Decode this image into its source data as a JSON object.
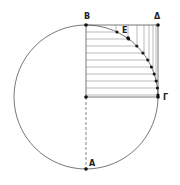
{
  "diagram": {
    "type": "geometric-construction",
    "circle": {
      "cx": 86,
      "cy": 97,
      "r": 72
    },
    "points": [
      {
        "name": "B",
        "x": 86,
        "y": 25,
        "label_x": 84,
        "label_y": 19
      },
      {
        "name": "Δ",
        "x": 158,
        "y": 25,
        "label_x": 154,
        "label_y": 19
      },
      {
        "name": "Γ",
        "x": 158,
        "y": 97,
        "label_x": 163,
        "label_y": 100
      },
      {
        "name": "A",
        "x": 86,
        "y": 169,
        "label_x": 89,
        "label_y": 166
      },
      {
        "name": "E",
        "x": 128,
        "y": 38,
        "label_x": 122,
        "label_y": 33
      }
    ],
    "horizontal_strip_ys": [
      32,
      39,
      46,
      53,
      60,
      67,
      74,
      81,
      88,
      95
    ],
    "vertical_strip_xs": [
      116,
      128,
      137,
      144,
      149,
      153,
      156
    ]
  }
}
